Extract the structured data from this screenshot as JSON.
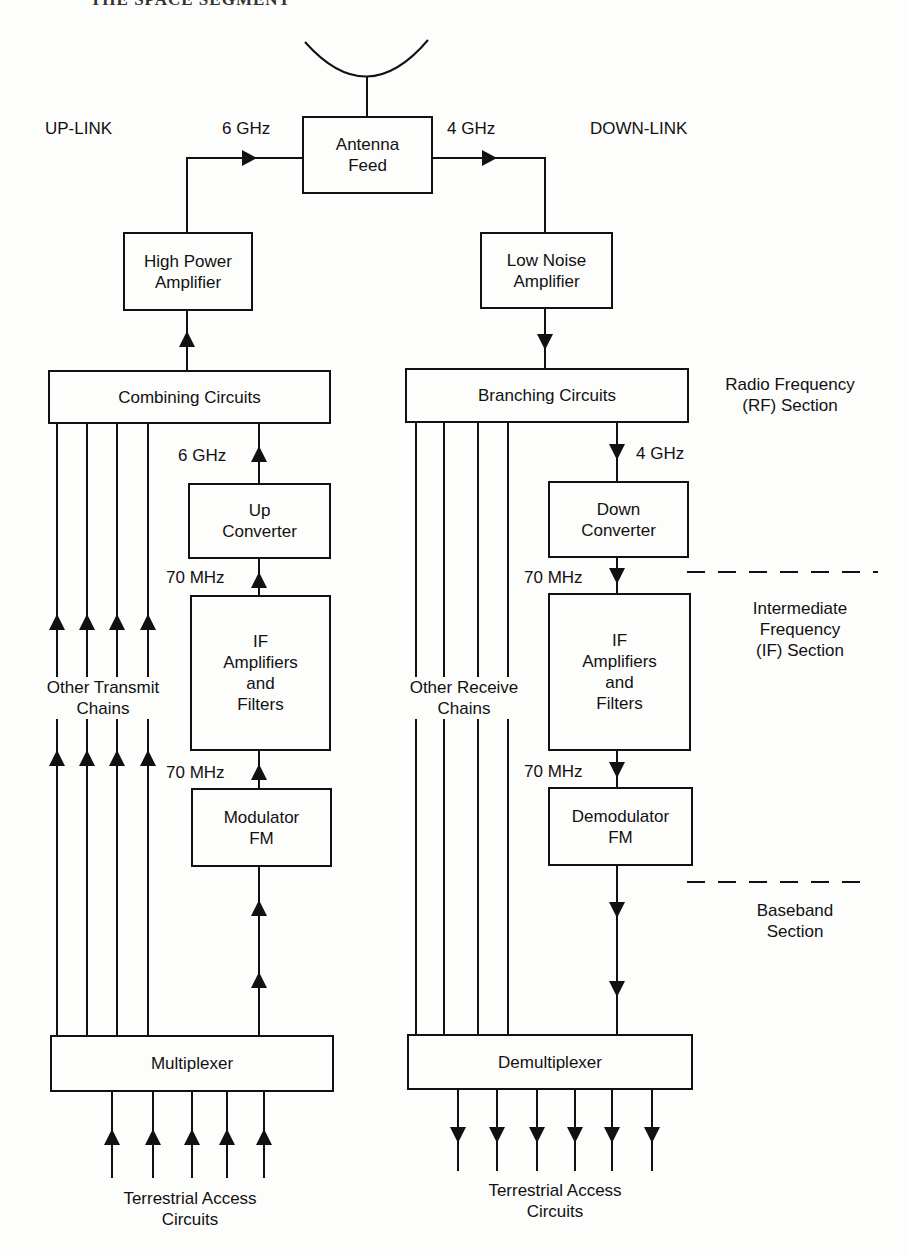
{
  "page_header": "THE SPACE SEGMENT",
  "links": {
    "uplink": "UP-LINK",
    "downlink": "DOWN-LINK"
  },
  "freq": {
    "up_rf": "6 GHz",
    "down_rf": "4 GHz",
    "up_rf_chain": "6 GHz",
    "down_rf_chain": "4 GHz",
    "up_if_top": "70 MHz",
    "up_if_bottom": "70 MHz",
    "down_if_top": "70 MHz",
    "down_if_bottom": "70 MHz"
  },
  "blocks": {
    "antenna_feed": "Antenna\nFeed",
    "hpa": "High Power\nAmplifier",
    "lna": "Low Noise\nAmplifier",
    "combining": "Combining Circuits",
    "branching": "Branching Circuits",
    "up_converter": "Up\nConverter",
    "down_converter": "Down\nConverter",
    "if_up": "IF\nAmplifiers\nand\nFilters",
    "if_down": "IF\nAmplifiers\nand\nFilters",
    "modulator": "Modulator\nFM",
    "demodulator": "Demodulator\nFM",
    "multiplexer": "Multiplexer",
    "demultiplexer": "Demultiplexer"
  },
  "chains": {
    "transmit": "Other Transmit\nChains",
    "receive": "Other Receive\nChains"
  },
  "sections": {
    "rf": "Radio Frequency\n(RF) Section",
    "if": "Intermediate\nFrequency\n(IF) Section",
    "baseband": "Baseband\nSection"
  },
  "terrestrial": {
    "up": "Terrestrial Access\nCircuits",
    "down": "Terrestrial Access\nCircuits"
  }
}
